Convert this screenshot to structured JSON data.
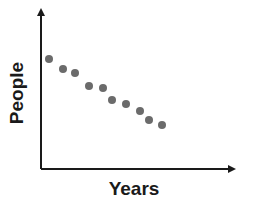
{
  "chart_data": {
    "type": "scatter",
    "title": "",
    "xlabel": "Years",
    "ylabel": "People",
    "x_ticks": [],
    "y_ticks": [],
    "grid": false,
    "legend": null,
    "trend": "negative correlation (decreasing)",
    "axis_units": "relative (no numeric scale shown)",
    "xlim": [
      0,
      195
    ],
    "ylim": [
      0,
      161
    ],
    "series": [
      {
        "name": "People",
        "color": "#6b6b6b",
        "points": [
          {
            "x": 8,
            "y": 110
          },
          {
            "x": 22,
            "y": 100
          },
          {
            "x": 34,
            "y": 96
          },
          {
            "x": 48,
            "y": 83
          },
          {
            "x": 62,
            "y": 81
          },
          {
            "x": 71,
            "y": 69
          },
          {
            "x": 85,
            "y": 65
          },
          {
            "x": 99,
            "y": 58
          },
          {
            "x": 108,
            "y": 49
          },
          {
            "x": 121,
            "y": 44
          }
        ]
      }
    ]
  },
  "colors": {
    "axis": "#1a1a1a",
    "point": "#6b6b6b",
    "background": "#ffffff"
  }
}
